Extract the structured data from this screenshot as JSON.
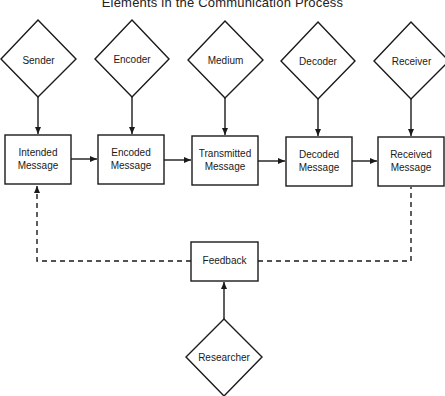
{
  "title": "Elements in the Communication Process",
  "actors": [
    {
      "id": "sender",
      "label": "Sender"
    },
    {
      "id": "encoder",
      "label": "Encoder"
    },
    {
      "id": "medium",
      "label": "Medium"
    },
    {
      "id": "decoder",
      "label": "Decoder"
    },
    {
      "id": "receiver",
      "label": "Receiver"
    }
  ],
  "messages": [
    {
      "id": "intended",
      "line1": "Intended",
      "line2": "Message"
    },
    {
      "id": "encoded",
      "line1": "Encoded",
      "line2": "Message"
    },
    {
      "id": "transmitted",
      "line1": "Transmitted",
      "line2": "Message"
    },
    {
      "id": "decoded",
      "line1": "Decoded",
      "line2": "Message"
    },
    {
      "id": "received",
      "line1": "Received",
      "line2": "Message"
    }
  ],
  "feedback": {
    "label": "Feedback"
  },
  "researcher": {
    "label": "Researcher"
  },
  "colors": {
    "stroke": "#1a1a1a",
    "background": "#ffffff"
  }
}
